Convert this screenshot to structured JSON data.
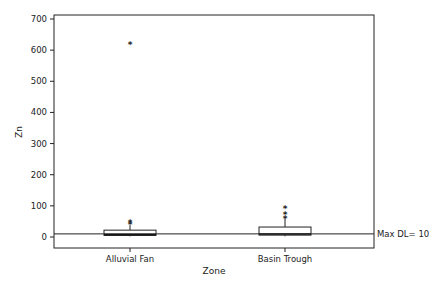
{
  "chart_data": {
    "type": "box",
    "title": "",
    "xlabel": "Zone",
    "ylabel": "Zn",
    "ylim": [
      -35,
      715
    ],
    "yticks": [
      0,
      100,
      200,
      300,
      400,
      500,
      600,
      700
    ],
    "categories": [
      "Alluvial Fan",
      "Basin Trough"
    ],
    "boxes": [
      {
        "name": "Alluvial Fan",
        "q1": 5,
        "median": 8,
        "q3": 22,
        "whisker_low": 2,
        "whisker_high": 38,
        "outliers": [
          42,
          48,
          620
        ]
      },
      {
        "name": "Basin Trough",
        "q1": 6,
        "median": 10,
        "q3": 32,
        "whisker_low": 2,
        "whisker_high": 60,
        "outliers": [
          61,
          74,
          93
        ]
      }
    ],
    "reference_line": {
      "value": 10,
      "label": "Max DL= 10"
    },
    "grid": false,
    "legend": null
  }
}
